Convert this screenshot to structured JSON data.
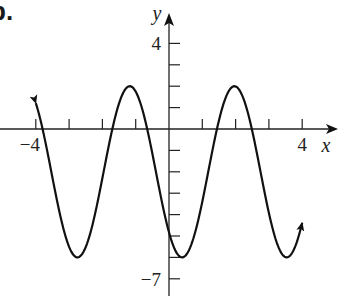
{
  "problem": {
    "label": "b."
  },
  "chart_data": {
    "type": "line",
    "title": "",
    "xlabel": "x",
    "ylabel": "y",
    "x_tick_labels": [
      {
        "value": -4,
        "label": "−4"
      },
      {
        "value": 4,
        "label": "4"
      }
    ],
    "y_tick_labels": [
      {
        "value": 4,
        "label": "4"
      },
      {
        "value": -7,
        "label": "−7"
      }
    ],
    "x_ticks": [
      -4,
      -3,
      -2,
      -1,
      1,
      2,
      3,
      4
    ],
    "y_ticks": [
      4,
      3,
      2,
      1,
      -1,
      -2,
      -3,
      -4,
      -5,
      -6,
      -7
    ],
    "xlim": [
      -4,
      4
    ],
    "ylim": [
      -7,
      4
    ],
    "grid": false,
    "legend": null,
    "function": "y = -4cos(2x - π/4) - 2",
    "amplitude": 4,
    "period": 3.1416,
    "midline": -2,
    "max": 2,
    "min": -6,
    "series": [
      {
        "name": "curve",
        "x": [
          -4.0,
          -3.5,
          -3.0,
          -2.75,
          -2.5,
          -2.0,
          -1.5,
          -1.18,
          -1.0,
          -0.5,
          0.0,
          0.39,
          0.5,
          1.0,
          1.5,
          1.96,
          2.0,
          2.5,
          3.0,
          3.53,
          4.0
        ],
        "values": [
          1.21,
          -1.54,
          -5.1,
          -5.95,
          -5.59,
          -1.26,
          1.62,
          2.0,
          1.87,
          -1.53,
          -4.83,
          -6.0,
          -5.91,
          -3.42,
          0.83,
          2.0,
          1.99,
          0.21,
          -3.5,
          -6.0,
          -4.38
        ],
        "arrows": "both ends"
      }
    ],
    "key_points": {
      "maxima": [
        [
          -1.18,
          2
        ],
        [
          1.96,
          2
        ]
      ],
      "minima": [
        [
          -2.75,
          -6
        ],
        [
          0.39,
          -6
        ],
        [
          3.53,
          -6
        ]
      ]
    }
  }
}
